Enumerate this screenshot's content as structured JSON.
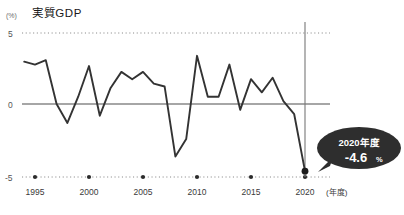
{
  "chart_data": {
    "type": "line",
    "title": "実質GDP",
    "ylabel": "(%)",
    "xlabel": "(年度)",
    "ylim": [
      -5,
      5
    ],
    "yticks": [
      5,
      0,
      -5
    ],
    "ytick_labels": [
      "5",
      "0",
      "-5"
    ],
    "xlim": [
      1994,
      2021
    ],
    "xticks": [
      1995,
      2000,
      2005,
      2010,
      2015,
      2020
    ],
    "xtick_labels": [
      "1995",
      "2000",
      "2005",
      "2010",
      "2015",
      "2020"
    ],
    "grid": "dotted-horizontal",
    "legend": "none",
    "x": [
      1994,
      1995,
      1996,
      1997,
      1998,
      1999,
      2000,
      2001,
      2002,
      2003,
      2004,
      2005,
      2006,
      2007,
      2008,
      2009,
      2010,
      2011,
      2012,
      2013,
      2014,
      2015,
      2016,
      2017,
      2018,
      2019,
      2020
    ],
    "values": [
      2.9,
      2.7,
      3.0,
      0.0,
      -1.3,
      0.5,
      2.6,
      -0.8,
      1.1,
      2.2,
      1.7,
      2.2,
      1.4,
      1.2,
      -3.6,
      -2.4,
      3.3,
      0.5,
      0.5,
      2.7,
      -0.4,
      1.7,
      0.8,
      1.8,
      0.2,
      -0.7,
      -4.6
    ],
    "highlight": {
      "year": 2020,
      "value": -4.6,
      "label_year": "2020年度",
      "label_value": "-4.6",
      "label_unit": "%",
      "marker": "dot",
      "vline": true
    },
    "colors": {
      "line": "#333333",
      "zero_axis": "#888888",
      "grid": "#8a8a8a",
      "callout_bg": "#2e2e2e",
      "callout_text": "#ffffff",
      "vline": "#777777"
    }
  }
}
